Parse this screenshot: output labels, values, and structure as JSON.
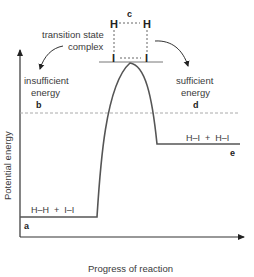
{
  "diagram": {
    "axis_labels": {
      "y": "Potential energy",
      "x": "Progress of reaction"
    },
    "annotations": {
      "transition_state_line1": "transition state",
      "transition_state_line2": "complex",
      "insufficient_line1": "insufficient",
      "insufficient_line2": "energy",
      "sufficient_line1": "sufficient",
      "sufficient_line2": "energy"
    },
    "point_labels": {
      "a": "a",
      "b": "b",
      "c": "c",
      "d": "d",
      "e": "e"
    },
    "species": {
      "reactants": "H–H  +  I–I",
      "products": "H–I  +  H–I"
    },
    "complex_atoms": {
      "top_left": "H",
      "top_right": "H",
      "bottom_left": "I",
      "bottom_right": "I"
    },
    "colors": {
      "curve": "#555555",
      "axis": "#333333",
      "dashed": "#aaaaaa",
      "text": "#3a3a3a"
    }
  }
}
